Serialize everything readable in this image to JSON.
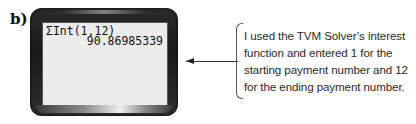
{
  "part_label": "b)",
  "calculator": {
    "screen_lines": {
      "command": "ΣInt(1,12)",
      "result": "90.86985339"
    },
    "frame_color": "#1f1f1f",
    "screen_color": "#ececec"
  },
  "annotation": {
    "arrow_direction": "left",
    "text": "I used the TVM Solver’s interest function and entered 1 for the starting payment number and 12 for the ending payment number."
  }
}
